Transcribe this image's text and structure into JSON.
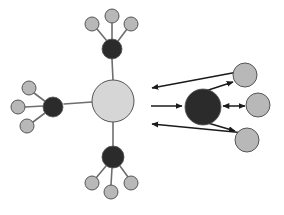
{
  "diagram": {
    "canvas": {
      "width": 284,
      "height": 215,
      "background": "#ffffff"
    },
    "colors": {
      "hub_dark": "#2b2b2b",
      "satellite_gray": "#b8b8b8",
      "center_light": "#d6d6d6",
      "node_stroke": "#555555",
      "edge": "#6e6e6e",
      "arrow": "#1a1a1a",
      "background": "#ffffff"
    },
    "nodes": [
      {
        "id": "center-hub",
        "label": "",
        "kind": "center",
        "fill": "#d6d6d6",
        "cx": 113,
        "cy": 101,
        "r": 21
      },
      {
        "id": "top-hub",
        "label": "",
        "kind": "hub",
        "fill": "#2b2b2b",
        "cx": 112,
        "cy": 49,
        "r": 10
      },
      {
        "id": "top-sat-1",
        "label": "",
        "kind": "satellite",
        "fill": "#b8b8b8",
        "cx": 92,
        "cy": 24,
        "r": 7
      },
      {
        "id": "top-sat-2",
        "label": "",
        "kind": "satellite",
        "fill": "#b8b8b8",
        "cx": 112,
        "cy": 16,
        "r": 7
      },
      {
        "id": "top-sat-3",
        "label": "",
        "kind": "satellite",
        "fill": "#b8b8b8",
        "cx": 131,
        "cy": 24,
        "r": 7
      },
      {
        "id": "left-hub",
        "label": "",
        "kind": "hub",
        "fill": "#2b2b2b",
        "cx": 53,
        "cy": 107,
        "r": 10
      },
      {
        "id": "left-sat-1",
        "label": "",
        "kind": "satellite",
        "fill": "#b8b8b8",
        "cx": 29,
        "cy": 88,
        "r": 7
      },
      {
        "id": "left-sat-2",
        "label": "",
        "kind": "satellite",
        "fill": "#b8b8b8",
        "cx": 18,
        "cy": 107,
        "r": 7
      },
      {
        "id": "left-sat-3",
        "label": "",
        "kind": "satellite",
        "fill": "#b8b8b8",
        "cx": 27,
        "cy": 126,
        "r": 7
      },
      {
        "id": "bottom-hub",
        "label": "",
        "kind": "hub",
        "fill": "#2b2b2b",
        "cx": 113,
        "cy": 157,
        "r": 11
      },
      {
        "id": "bottom-sat-1",
        "label": "",
        "kind": "satellite",
        "fill": "#b8b8b8",
        "cx": 92,
        "cy": 183,
        "r": 7
      },
      {
        "id": "bottom-sat-2",
        "label": "",
        "kind": "satellite",
        "fill": "#b8b8b8",
        "cx": 111,
        "cy": 192,
        "r": 7
      },
      {
        "id": "bottom-sat-3",
        "label": "",
        "kind": "satellite",
        "fill": "#b8b8b8",
        "cx": 131,
        "cy": 183,
        "r": 7
      },
      {
        "id": "right-hub",
        "label": "",
        "kind": "hub",
        "fill": "#2b2b2b",
        "cx": 203,
        "cy": 107,
        "r": 18
      },
      {
        "id": "right-sat-1",
        "label": "",
        "kind": "satellite",
        "fill": "#b8b8b8",
        "cx": 245,
        "cy": 75,
        "r": 12
      },
      {
        "id": "right-sat-2",
        "label": "",
        "kind": "satellite",
        "fill": "#b8b8b8",
        "cx": 258,
        "cy": 105,
        "r": 12
      },
      {
        "id": "right-sat-3",
        "label": "",
        "kind": "satellite",
        "fill": "#b8b8b8",
        "cx": 247,
        "cy": 140,
        "r": 12
      }
    ],
    "edges": [
      {
        "id": "edge-top-hub-center",
        "from": "top-hub",
        "to": "center-hub",
        "x1": 112,
        "y1": 59,
        "x2": 113,
        "y2": 80,
        "style": "plain"
      },
      {
        "id": "edge-top-sat-1",
        "from": "top-sat-1",
        "to": "top-hub",
        "x1": 97,
        "y1": 29,
        "x2": 107,
        "y2": 41,
        "style": "plain"
      },
      {
        "id": "edge-top-sat-2",
        "from": "top-sat-2",
        "to": "top-hub",
        "x1": 112,
        "y1": 23,
        "x2": 112,
        "y2": 39,
        "style": "plain"
      },
      {
        "id": "edge-top-sat-3",
        "from": "top-sat-3",
        "to": "top-hub",
        "x1": 127,
        "y1": 29,
        "x2": 118,
        "y2": 41,
        "style": "plain"
      },
      {
        "id": "edge-left-hub-center",
        "from": "left-hub",
        "to": "center-hub",
        "x1": 64,
        "y1": 104,
        "x2": 92,
        "y2": 102,
        "style": "plain"
      },
      {
        "id": "edge-left-sat-1",
        "from": "left-sat-1",
        "to": "left-hub",
        "x1": 34,
        "y1": 93,
        "x2": 46,
        "y2": 102,
        "style": "plain"
      },
      {
        "id": "edge-left-sat-2",
        "from": "left-sat-2",
        "to": "left-hub",
        "x1": 25,
        "y1": 107,
        "x2": 43,
        "y2": 106,
        "style": "plain"
      },
      {
        "id": "edge-left-sat-3",
        "from": "left-sat-3",
        "to": "left-hub",
        "x1": 33,
        "y1": 122,
        "x2": 45,
        "y2": 113,
        "style": "plain"
      },
      {
        "id": "edge-bottom-hub-center",
        "from": "center-hub",
        "to": "bottom-hub",
        "x1": 113,
        "y1": 122,
        "x2": 113,
        "y2": 146,
        "style": "plain"
      },
      {
        "id": "edge-bottom-sat-1",
        "from": "bottom-hub",
        "to": "bottom-sat-1",
        "x1": 106,
        "y1": 166,
        "x2": 96,
        "y2": 178,
        "style": "plain"
      },
      {
        "id": "edge-bottom-sat-2",
        "from": "bottom-hub",
        "to": "bottom-sat-2",
        "x1": 112,
        "y1": 168,
        "x2": 111,
        "y2": 185,
        "style": "plain"
      },
      {
        "id": "edge-bottom-sat-3",
        "from": "bottom-hub",
        "to": "bottom-sat-3",
        "x1": 120,
        "y1": 166,
        "x2": 128,
        "y2": 177,
        "style": "plain"
      }
    ],
    "arrows": [
      {
        "id": "arrow-out-top-left",
        "label": "outgoing-upper-left",
        "x1": 243,
        "y1": 71,
        "x2": 152,
        "y2": 88,
        "heads": "end"
      },
      {
        "id": "arrow-in-middle-left",
        "label": "incoming-middle-left",
        "x1": 151,
        "y1": 106,
        "x2": 182,
        "y2": 106,
        "heads": "end"
      },
      {
        "id": "arrow-out-bottom-left",
        "label": "outgoing-lower-left",
        "x1": 245,
        "y1": 133,
        "x2": 152,
        "y2": 124,
        "heads": "end"
      },
      {
        "id": "arrow-hub-sat-top",
        "label": "hub-to-upper-right-satellite",
        "x1": 190,
        "y1": 96,
        "x2": 233,
        "y2": 82,
        "heads": "both"
      },
      {
        "id": "arrow-hub-sat-middle",
        "label": "hub-to-middle-right-satellite",
        "x1": 223,
        "y1": 106,
        "x2": 245,
        "y2": 106,
        "heads": "both"
      },
      {
        "id": "arrow-hub-sat-bottom",
        "label": "hub-to-lower-right-satellite",
        "x1": 191,
        "y1": 118,
        "x2": 235,
        "y2": 131,
        "heads": "both"
      }
    ],
    "groups": [
      {
        "id": "group-top",
        "label": "top-cluster"
      },
      {
        "id": "group-left",
        "label": "left-cluster"
      },
      {
        "id": "group-bottom",
        "label": "bottom-cluster"
      },
      {
        "id": "group-right",
        "label": "right-cluster"
      },
      {
        "id": "group-center",
        "label": "center-node"
      }
    ]
  }
}
